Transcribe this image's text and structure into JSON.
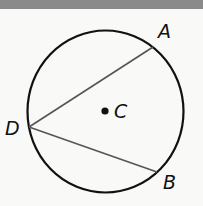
{
  "figure": {
    "type": "circle-with-inscribed-angle",
    "circle": {
      "cx": 105.5,
      "cy": 111.5,
      "rx": 78,
      "ry": 81,
      "stroke": "#111111"
    },
    "center": {
      "name": "C",
      "x": 105,
      "y": 111
    },
    "points": [
      {
        "name": "A",
        "x": 153,
        "y": 47
      },
      {
        "name": "D",
        "x": 29,
        "y": 127
      },
      {
        "name": "B",
        "x": 157,
        "y": 172
      }
    ],
    "segments": [
      {
        "from": "D",
        "to": "A"
      },
      {
        "from": "D",
        "to": "B"
      }
    ],
    "colors": {
      "circle": "#111111",
      "chord": "#555555",
      "top_bar": "#8a8a8a"
    }
  },
  "labels": {
    "A": "A",
    "B": "B",
    "C": "C",
    "D": "D"
  }
}
